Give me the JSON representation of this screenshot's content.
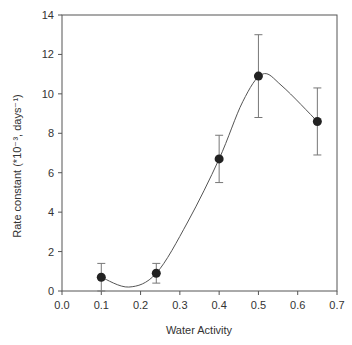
{
  "chart_data": {
    "type": "scatter",
    "title": "",
    "xlabel": "Water Activity",
    "ylabel": "Rate constant (*10⁻³, days⁻¹)",
    "xlim": [
      0.0,
      0.7
    ],
    "ylim": [
      0,
      14
    ],
    "x_ticks": [
      "0.0",
      "0.1",
      "0.2",
      "0.3",
      "0.4",
      "0.5",
      "0.6",
      "0.7"
    ],
    "y_ticks": [
      "0",
      "2",
      "4",
      "6",
      "8",
      "10",
      "12",
      "14"
    ],
    "grid": false,
    "legend": null,
    "series": [
      {
        "name": "Rate constant",
        "marker": "filled-circle",
        "color": "#222222",
        "x": [
          0.1,
          0.24,
          0.4,
          0.5,
          0.65
        ],
        "y": [
          0.7,
          0.9,
          6.7,
          10.9,
          8.6
        ],
        "error_low": [
          0.0,
          0.4,
          5.5,
          8.8,
          6.9
        ],
        "error_high": [
          1.4,
          1.4,
          7.9,
          13.0,
          10.3
        ]
      }
    ],
    "fit_curve": {
      "type": "smooth-spline",
      "color": "#555555",
      "approx_points": [
        [
          0.1,
          0.7
        ],
        [
          0.17,
          0.2
        ],
        [
          0.24,
          0.9
        ],
        [
          0.32,
          3.5
        ],
        [
          0.4,
          6.7
        ],
        [
          0.46,
          9.6
        ],
        [
          0.51,
          11.0
        ],
        [
          0.56,
          10.4
        ],
        [
          0.65,
          8.6
        ]
      ]
    }
  },
  "labels": {
    "xlabel": "Water Activity",
    "ylabel": "Rate constant (*10⁻³, days⁻¹)"
  }
}
